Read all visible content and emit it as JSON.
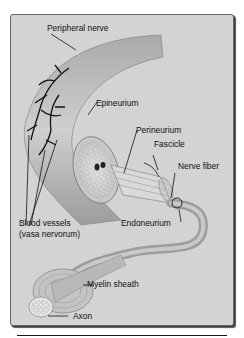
{
  "figure": {
    "type": "anatomical-illustration",
    "colors": {
      "background": "#d3d3d3",
      "border": "#6a6a6a",
      "nerve_fill": "#bdbdbd",
      "vessels": "#111111",
      "label_text": "#111111"
    },
    "labels": [
      {
        "id": "peripheral-nerve",
        "text": "Peripheral nerve"
      },
      {
        "id": "epineurium",
        "text": "Epineurium"
      },
      {
        "id": "perineurium",
        "text": "Perineurium"
      },
      {
        "id": "fascicle",
        "text": "Fascicle"
      },
      {
        "id": "nerve-fiber",
        "text": "Nerve fiber"
      },
      {
        "id": "blood-vessels",
        "text": "Blood vessels"
      },
      {
        "id": "vasa-nervorum",
        "text": "(vasa nervorum)"
      },
      {
        "id": "endoneurium",
        "text": "Endoneurium"
      },
      {
        "id": "myelin-sheath",
        "text": "Myelin sheath"
      },
      {
        "id": "axon",
        "text": "Axon"
      }
    ]
  }
}
